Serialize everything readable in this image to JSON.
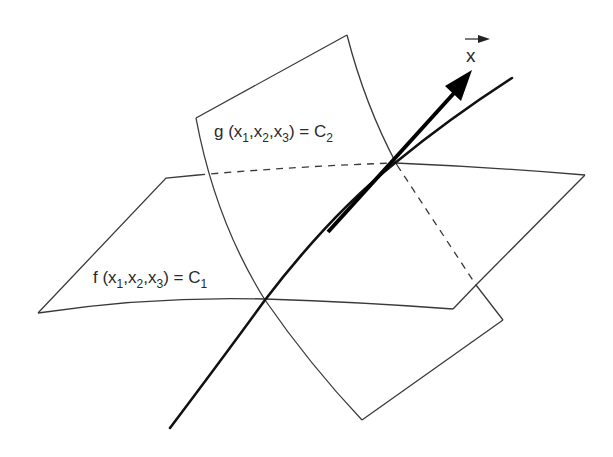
{
  "diagram": {
    "type": "intersecting-surfaces",
    "labels": {
      "surface_g": {
        "func": "g",
        "args": [
          "x1",
          "x2",
          "x3"
        ],
        "constant": "C2",
        "text_prefix": "g (x",
        "sub1": "1",
        "sep1": ",x",
        "sub2": "2",
        "sep2": ",x",
        "sub3": "3",
        "suffix": ") = C",
        "const_sub": "2"
      },
      "surface_f": {
        "func": "f",
        "args": [
          "x1",
          "x2",
          "x3"
        ],
        "constant": "C1",
        "text_prefix": "f (x",
        "sub1": "1",
        "sep1": ",x",
        "sub2": "2",
        "sep2": ",x",
        "sub3": "3",
        "suffix": ") = C",
        "const_sub": "1"
      },
      "vector": {
        "symbol": "x",
        "decoration": "arrow-over"
      }
    },
    "colors": {
      "surface_edge": "#3a3a3a",
      "curve": "#111111",
      "vector": "#000000",
      "background": "#ffffff"
    }
  }
}
